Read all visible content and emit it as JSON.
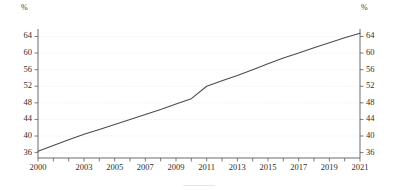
{
  "chart_data": {
    "type": "line",
    "title": "",
    "subtitle": "",
    "xlabel": "",
    "ylabel": "",
    "unit_label_left": "%",
    "unit_label_right": "%",
    "grid": true,
    "grid_orientation": "horizontal",
    "legend": "none",
    "line_color": "#4a4a52",
    "grid_color": "#e8e8ee",
    "axis_color": "#5a5a5a",
    "xlim": [
      2000,
      2021
    ],
    "ylim": [
      34.7,
      65.8
    ],
    "yticks": [
      36,
      40,
      44,
      48,
      52,
      56,
      60,
      64
    ],
    "ytick_labels": [
      "36",
      "40",
      "44",
      "48",
      "52",
      "56",
      "60",
      "64"
    ],
    "ytick_labels_right": [
      "36",
      "40",
      "44",
      "48",
      "52",
      "56",
      "60",
      "64"
    ],
    "xticks": [
      2000,
      2001,
      2002,
      2003,
      2004,
      2005,
      2006,
      2007,
      2008,
      2009,
      2010,
      2011,
      2012,
      2013,
      2014,
      2015,
      2016,
      2017,
      2018,
      2019,
      2020,
      2021
    ],
    "xtick_labels_shown": [
      "2000",
      "2003",
      "2005",
      "2007",
      "2009",
      "2011",
      "2013",
      "2015",
      "2017",
      "2019",
      "2021"
    ],
    "xtick_label_values": [
      2000,
      2003,
      2005,
      2007,
      2009,
      2011,
      2013,
      2015,
      2017,
      2019,
      2021
    ],
    "x": [
      2000,
      2001,
      2002,
      2003,
      2004,
      2005,
      2006,
      2007,
      2008,
      2009,
      2010,
      2011,
      2012,
      2013,
      2014,
      2015,
      2016,
      2017,
      2018,
      2019,
      2020,
      2021
    ],
    "values": [
      36.3,
      37.7,
      39.1,
      40.4,
      41.6,
      42.8,
      44.0,
      45.2,
      46.4,
      47.7,
      49.0,
      52.0,
      53.3,
      54.6,
      56.0,
      57.4,
      58.8,
      60.0,
      61.3,
      62.5,
      63.7,
      64.8
    ],
    "series": [
      {
        "name": "series-1",
        "color": "#4a4a52",
        "values": [
          36.3,
          37.7,
          39.1,
          40.4,
          41.6,
          42.8,
          44.0,
          45.2,
          46.4,
          47.7,
          49.0,
          52.0,
          53.3,
          54.6,
          56.0,
          57.4,
          58.8,
          60.0,
          61.3,
          62.5,
          63.7,
          64.8
        ]
      }
    ],
    "annotations": []
  },
  "caption": {
    "text": "————"
  }
}
